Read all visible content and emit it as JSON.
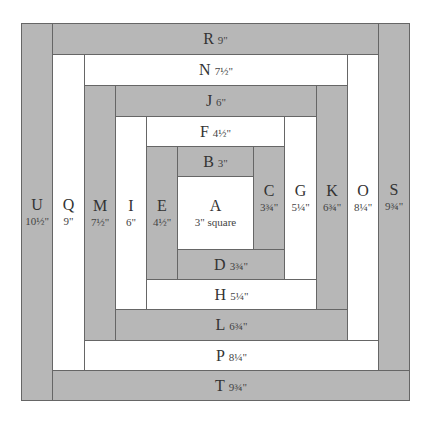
{
  "diagram": {
    "colors": {
      "gray": "#b7b7b7",
      "white": "#ffffff",
      "border": "#666666"
    },
    "center": {
      "letter": "A",
      "dim": "3\" square"
    },
    "horizontal": {
      "R": {
        "letter": "R",
        "dim": "9\""
      },
      "N": {
        "letter": "N",
        "dim": "7½\""
      },
      "J": {
        "letter": "J",
        "dim": "6\""
      },
      "F": {
        "letter": "F",
        "dim": "4½\""
      },
      "B": {
        "letter": "B",
        "dim": "3\""
      },
      "D": {
        "letter": "D",
        "dim": "3¾\""
      },
      "H": {
        "letter": "H",
        "dim": "5¼\""
      },
      "L": {
        "letter": "L",
        "dim": "6¾\""
      },
      "P": {
        "letter": "P",
        "dim": "8¼\""
      },
      "T": {
        "letter": "T",
        "dim": "9¾\""
      }
    },
    "vertical": {
      "U": {
        "letter": "U",
        "dim": "10½\""
      },
      "Q": {
        "letter": "Q",
        "dim": "9\""
      },
      "M": {
        "letter": "M",
        "dim": "7½\""
      },
      "I": {
        "letter": "I",
        "dim": "6\""
      },
      "E": {
        "letter": "E",
        "dim": "4½\""
      },
      "C": {
        "letter": "C",
        "dim": "3¾\""
      },
      "G": {
        "letter": "G",
        "dim": "5¼\""
      },
      "K": {
        "letter": "K",
        "dim": "6¾\""
      },
      "O": {
        "letter": "O",
        "dim": "8¼\""
      },
      "S": {
        "letter": "S",
        "dim": "9¾\""
      }
    }
  }
}
